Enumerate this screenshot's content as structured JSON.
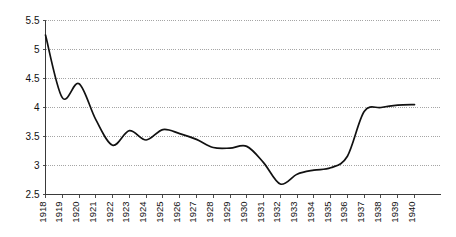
{
  "chart_data": {
    "type": "line",
    "title": "",
    "subtitle": "",
    "xlabel": "",
    "ylabel": "",
    "grid": "horizontal-dotted",
    "legend": "none",
    "xlim": [
      1918,
      1940
    ],
    "ylim": [
      2.5,
      5.5
    ],
    "y_ticks": [
      2.5,
      3,
      3.5,
      4,
      4.5,
      5,
      5.5
    ],
    "y_tick_labels": [
      "2.5",
      "3",
      "3.5",
      "4",
      "4.5",
      "5",
      "5.5"
    ],
    "x_tick_rotation": 90,
    "categories": [
      "1918",
      "1919",
      "1920",
      "1921",
      "1922",
      "1923",
      "1924",
      "1925",
      "1926",
      "1927",
      "1928",
      "1929",
      "1930",
      "1931",
      "1932",
      "1933",
      "1934",
      "1935",
      "1936",
      "1937",
      "1938",
      "1939",
      "1940"
    ],
    "x": [
      1918,
      1919,
      1920,
      1921,
      1922,
      1923,
      1924,
      1925,
      1926,
      1927,
      1928,
      1929,
      1930,
      1931,
      1932,
      1933,
      1934,
      1935,
      1936,
      1937,
      1938,
      1939,
      1940
    ],
    "series": [
      {
        "name": "series-1",
        "color": "#111111",
        "values": [
          5.25,
          4.17,
          4.41,
          3.79,
          3.35,
          3.6,
          3.44,
          3.62,
          3.55,
          3.45,
          3.31,
          3.3,
          3.33,
          3.05,
          2.68,
          2.85,
          2.92,
          2.96,
          3.16,
          3.93,
          4.0,
          4.04,
          4.05
        ]
      }
    ]
  },
  "axes": {
    "y_labels": [
      "5.5",
      "5",
      "4.5",
      "4",
      "3.5",
      "3",
      "2.5"
    ],
    "x_labels": [
      "1918",
      "1919",
      "1920",
      "1921",
      "1922",
      "1923",
      "1924",
      "1925",
      "1926",
      "1927",
      "1928",
      "1929",
      "1930",
      "1931",
      "1932",
      "1933",
      "1934",
      "1935",
      "1936",
      "1937",
      "1938",
      "1939",
      "1940"
    ]
  },
  "colors": {
    "line": "#111111",
    "grid": "#8f8f8f",
    "axis": "#3a3a3a",
    "background": "#ffffff",
    "text": "#111111"
  }
}
